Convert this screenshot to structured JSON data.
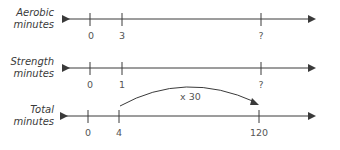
{
  "diagram": {
    "type": "double-number-line",
    "colors": {
      "line": "#3a3a3a",
      "text": "#555555"
    },
    "rows": [
      {
        "label_line1": "Aerobic",
        "label_line2": "minutes",
        "ticks": [
          {
            "label": "0"
          },
          {
            "label": "3"
          },
          {
            "label": "?"
          }
        ]
      },
      {
        "label_line1": "Strength",
        "label_line2": "minutes",
        "ticks": [
          {
            "label": "0"
          },
          {
            "label": "1"
          },
          {
            "label": "?"
          }
        ]
      },
      {
        "label_line1": "Total",
        "label_line2": "minutes",
        "ticks": [
          {
            "label": "0"
          },
          {
            "label": "4"
          },
          {
            "label": "120"
          }
        ]
      }
    ],
    "arc": {
      "label": "x 30",
      "from": "4",
      "to": "120"
    }
  }
}
